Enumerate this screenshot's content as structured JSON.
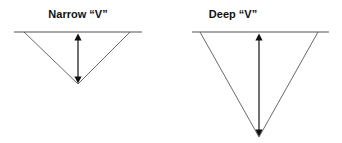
{
  "diagrams": [
    {
      "title": "Narrow “V”",
      "center_x": 78,
      "line": [
        14,
        142
      ],
      "top_y": 32,
      "v_left": 24,
      "v_right": 130,
      "apex_y": 84
    },
    {
      "title": "Deep “V”",
      "center_x": 259,
      "line": [
        192,
        329
      ],
      "top_y": 32,
      "v_left": 200,
      "v_right": 318,
      "apex_y": 137
    }
  ],
  "colors": {
    "line": "#555555",
    "arrow": "#111111"
  }
}
